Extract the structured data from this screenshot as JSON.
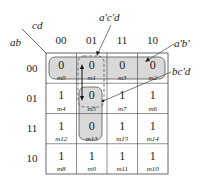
{
  "diagram": {
    "type": "karnaugh-map",
    "row_variables": "ab",
    "col_variables": "cd",
    "col_labels": [
      "00",
      "01",
      "11",
      "10"
    ],
    "row_labels": [
      "00",
      "01",
      "11",
      "10"
    ],
    "cells": [
      [
        {
          "v": "0",
          "m": "m0"
        },
        {
          "v": "0",
          "m": "m1"
        },
        {
          "v": "0",
          "m": "m3"
        },
        {
          "v": "0",
          "m": "m2"
        }
      ],
      [
        {
          "v": "1",
          "m": "m4"
        },
        {
          "v": "0",
          "m": "m5"
        },
        {
          "v": "1",
          "m": "m7"
        },
        {
          "v": "1",
          "m": "m6"
        }
      ],
      [
        {
          "v": "1",
          "m": "m12"
        },
        {
          "v": "0",
          "m": "m13"
        },
        {
          "v": "1",
          "m": "m15"
        },
        {
          "v": "1",
          "m": "m14"
        }
      ],
      [
        {
          "v": "1",
          "m": "m8"
        },
        {
          "v": "1",
          "m": "m9"
        },
        {
          "v": "1",
          "m": "m11"
        },
        {
          "v": "1",
          "m": "m10"
        }
      ]
    ],
    "groups": [
      {
        "label": "a'b'",
        "cells": [
          "m0",
          "m1",
          "m3",
          "m2"
        ],
        "style": "solid-shaded"
      },
      {
        "label": "a'c'd",
        "cells": [
          "m1",
          "m5"
        ],
        "style": "dashed"
      },
      {
        "label": "bc'd",
        "cells": [
          "m5",
          "m13"
        ],
        "style": "solid-shaded"
      }
    ],
    "colors": {
      "group_fill": "#d9d9d9",
      "line": "#444444"
    }
  }
}
